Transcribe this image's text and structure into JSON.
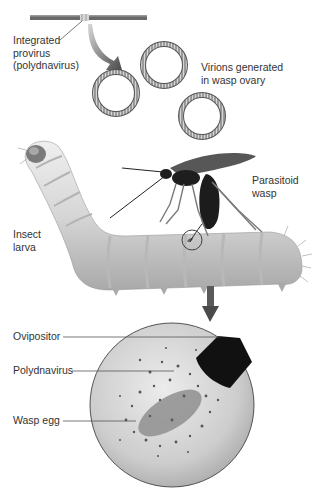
{
  "figure": {
    "labels": {
      "provirus": [
        "Integrated",
        "provirus",
        "(polydnavirus)"
      ],
      "virions": [
        "Virions generated",
        "in wasp ovary"
      ],
      "wasp": [
        "Parasitoid",
        "wasp"
      ],
      "larva": [
        "Insect",
        "larva"
      ],
      "ovipositor": "Ovipositor",
      "polydnavirus": "Polydnavirus",
      "egg": "Wasp egg"
    },
    "colors": {
      "background": "#ffffff",
      "larva_body": "#d4d4d4",
      "wasp_body": "#1e1e1e",
      "virion_ring": "#7a7a7a",
      "arrow": "#5a5a5a",
      "magnified_circle": "#cfcfcf",
      "egg": "#8f8f8f"
    }
  }
}
